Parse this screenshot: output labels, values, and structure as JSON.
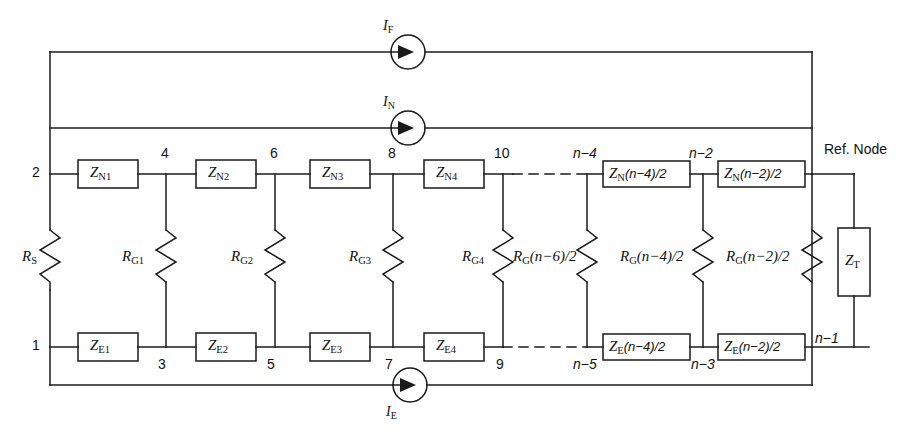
{
  "figure": {
    "kind": "circuit-diagram",
    "title_visible": false,
    "caption_fragment": "Figure  (bottom caption partially cropped)",
    "line_color": "#1a1a1a",
    "background": "#ffffff"
  },
  "buses": {
    "top_label": "I_F return bus",
    "second_label": "I_N return bus",
    "bottom_label": "I_E return bus",
    "ref_node_label": "Ref. Node"
  },
  "current_sources": [
    {
      "name": "if-source",
      "label_main": "I",
      "label_sub": "F"
    },
    {
      "name": "in-source",
      "label_main": "I",
      "label_sub": "N"
    },
    {
      "name": "ie-source",
      "label_main": "I",
      "label_sub": "E"
    }
  ],
  "series_top": [
    {
      "main": "Z",
      "sub": "N1",
      "paren": ""
    },
    {
      "main": "Z",
      "sub": "N2",
      "paren": ""
    },
    {
      "main": "Z",
      "sub": "N3",
      "paren": ""
    },
    {
      "main": "Z",
      "sub": "N4",
      "paren": ""
    },
    {
      "main": "Z",
      "sub": "N",
      "paren": "(n−4)/2"
    },
    {
      "main": "Z",
      "sub": "N",
      "paren": "(n−2)/2"
    }
  ],
  "series_bottom": [
    {
      "main": "Z",
      "sub": "E1",
      "paren": ""
    },
    {
      "main": "Z",
      "sub": "E2",
      "paren": ""
    },
    {
      "main": "Z",
      "sub": "E3",
      "paren": ""
    },
    {
      "main": "Z",
      "sub": "E4",
      "paren": ""
    },
    {
      "main": "Z",
      "sub": "E",
      "paren": "(n−4)/2"
    },
    {
      "main": "Z",
      "sub": "E",
      "paren": "(n−2)/2"
    }
  ],
  "shunt_resistors": [
    {
      "main": "R",
      "sub": "S",
      "paren": ""
    },
    {
      "main": "R",
      "sub": "G1",
      "paren": ""
    },
    {
      "main": "R",
      "sub": "G2",
      "paren": ""
    },
    {
      "main": "R",
      "sub": "G3",
      "paren": ""
    },
    {
      "main": "R",
      "sub": "G4",
      "paren": ""
    },
    {
      "main": "R",
      "sub": "G",
      "paren": "(n−6)/2"
    },
    {
      "main": "R",
      "sub": "G",
      "paren": "(n−4)/2"
    },
    {
      "main": "R",
      "sub": "G",
      "paren": "(n−2)/2"
    }
  ],
  "terminal_impedance": {
    "main": "Z",
    "sub": "T",
    "paren": ""
  },
  "node_numbers_top": [
    "2",
    "4",
    "6",
    "8",
    "10",
    "n−4",
    "n−2"
  ],
  "node_numbers_bottom": [
    "1",
    "3",
    "5",
    "7",
    "9",
    "n−5",
    "n−3",
    "n−1"
  ],
  "dash_break_note": "dashed continuation between node 10 / n−4 (top) and 9 / n−5 (bottom)"
}
